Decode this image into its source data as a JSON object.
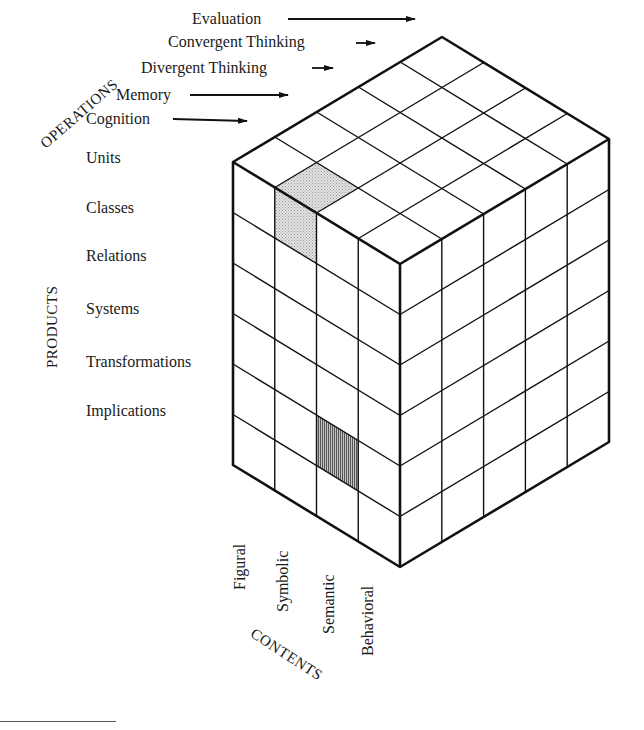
{
  "figure": {
    "type": "structure-of-intellect-cube",
    "axes": {
      "operations": {
        "title": "OPERATIONS",
        "items": [
          "Evaluation",
          "Convergent Thinking",
          "Divergent Thinking",
          "Memory",
          "Cognition"
        ]
      },
      "products": {
        "title": "PRODUCTS",
        "items": [
          "Units",
          "Classes",
          "Relations",
          "Systems",
          "Transformations",
          "Implications"
        ]
      },
      "contents": {
        "title": "CONTENTS",
        "items": [
          "Figural",
          "Symbolic",
          "Semantic",
          "Behavioral"
        ]
      }
    },
    "highlighted_cells": [
      {
        "operation": "Cognition",
        "product": "Units",
        "content": "Symbolic",
        "pattern": "dotted",
        "color": "#cfcfcf"
      },
      {
        "operation": "Cognition",
        "product": "Transformations",
        "content": "Semantic",
        "pattern": "vertical-lines",
        "color": "#8a8a8a"
      }
    ],
    "colors": {
      "line": "#111111",
      "background": "#ffffff"
    }
  }
}
